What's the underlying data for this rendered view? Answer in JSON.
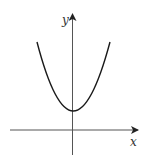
{
  "diagram": {
    "type": "function-graph",
    "axes": {
      "x_label": "x",
      "y_label": "y"
    },
    "curve": {
      "shape": "parabola",
      "opens": "up",
      "vertex_position": "on y-axis, above x-axis"
    },
    "colors": {
      "line": "#1a1a1a",
      "axis": "#333333",
      "background": "#ffffff"
    }
  }
}
